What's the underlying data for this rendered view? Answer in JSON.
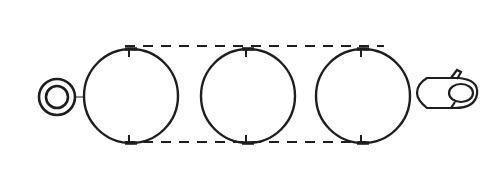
{
  "diagram": {
    "background": "#ffffff",
    "stroke_color": "#1e1e1e",
    "idler": {
      "cx": 57,
      "cy": 97,
      "outer_r": 18,
      "inner_r": 11
    },
    "connector": {
      "x1": 75,
      "y1": 97,
      "x2": 84,
      "y2": 97
    },
    "wheels": [
      {
        "cx": 131,
        "cy": 96,
        "r": 47
      },
      {
        "cx": 248,
        "cy": 96,
        "r": 47
      },
      {
        "cx": 363,
        "cy": 96,
        "r": 47
      }
    ],
    "belt": {
      "top": {
        "x1": 125,
        "y1": 46,
        "x2": 384,
        "y2": 46
      },
      "bottom": {
        "x1": 125,
        "y1": 142,
        "x2": 366,
        "y2": 142
      },
      "dash": "10 8"
    },
    "drive_mechanism": {
      "x": 415,
      "y": 68,
      "width": 64,
      "height": 42
    }
  }
}
